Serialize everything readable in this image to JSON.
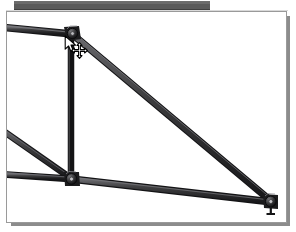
{
  "window": {
    "title": "",
    "toolbar": {
      "name": "toolbar-strip",
      "color": "#5a5a5a",
      "visible": true
    },
    "canvas": {
      "name": "drawing-canvas",
      "background": "#ffffff",
      "border_color": "#9a9a9a",
      "shadow_color": "#8c8c8c",
      "width": 279,
      "height": 210
    }
  },
  "colors": {
    "member_fill": "#3f3f41",
    "member_edge": "#1d1d1f",
    "member_highlight": "#6e6e72",
    "joint_fill": "#2b2b2d",
    "joint_edge": "#111113",
    "canvas": "#ffffff",
    "toolbar": "#5a5a5a",
    "shadow": "#8c8c8c",
    "cursor_fill": "#ffffff",
    "cursor_stroke": "#000000"
  },
  "structure": {
    "type": "truss-frame",
    "description": "Structural frame with top chord, bottom chord, vertical post and long diagonal",
    "joints": [
      {
        "id": "J1",
        "name": "joint-apex",
        "x": 64,
        "y": 22,
        "kind": "pin-connection",
        "label": ""
      },
      {
        "id": "J2",
        "name": "joint-mid-bottom",
        "x": 64,
        "y": 166,
        "kind": "pin-connection",
        "label": ""
      },
      {
        "id": "J3",
        "name": "joint-right-support",
        "x": 264,
        "y": 189,
        "kind": "roller-support",
        "label": ""
      }
    ],
    "members": [
      {
        "id": "M1",
        "name": "member-top-chord-left",
        "from": [
          -6,
          16
        ],
        "to": [
          64,
          22
        ],
        "thickness": 6
      },
      {
        "id": "M2",
        "name": "member-diagonal-main",
        "from": [
          64,
          22
        ],
        "to": [
          264,
          189
        ],
        "thickness": 6
      },
      {
        "id": "M3",
        "name": "member-vertical-post",
        "from": [
          64,
          22
        ],
        "to": [
          64,
          166
        ],
        "thickness": 5
      },
      {
        "id": "M4",
        "name": "member-web-diagonal",
        "from": [
          -6,
          118
        ],
        "to": [
          64,
          166
        ],
        "thickness": 5
      },
      {
        "id": "M5",
        "name": "member-bottom-chord-left",
        "from": [
          -6,
          163
        ],
        "to": [
          64,
          166
        ],
        "thickness": 5
      },
      {
        "id": "M6",
        "name": "member-bottom-chord",
        "from": [
          64,
          166
        ],
        "to": [
          264,
          189
        ],
        "thickness": 6
      }
    ]
  },
  "cursor": {
    "name": "mouse-cursor",
    "type": "arrow-with-move-handle",
    "arrow_x": 57,
    "arrow_y": 23,
    "move_x": 64,
    "move_y": 30,
    "tooltip": ""
  }
}
